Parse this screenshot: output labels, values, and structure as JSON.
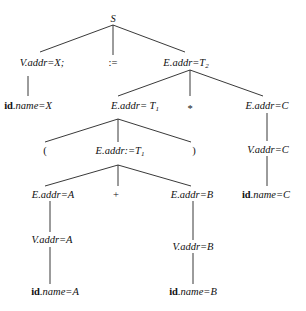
{
  "diagram": {
    "nodes": {
      "root": {
        "text": "S"
      },
      "v_x": {
        "text": "V.addr=X;"
      },
      "assign": {
        "text": ":="
      },
      "e_t2": {
        "text": "E.addr=T",
        "sub": "2"
      },
      "id_x": {
        "bold": "id",
        "text": ".name=X"
      },
      "e_t1": {
        "text": "E.addr= T",
        "sub": "1"
      },
      "star": {
        "text": "*"
      },
      "e_c": {
        "text": "E.addr=C"
      },
      "lparen": {
        "text": "("
      },
      "e_t1b": {
        "text": "E.addr:=T",
        "sub": "1"
      },
      "rparen": {
        "text": ")"
      },
      "v_c": {
        "text": "V.addr=C"
      },
      "e_a": {
        "text": "E.addr=A"
      },
      "plus": {
        "text": "+"
      },
      "e_b": {
        "text": "E.addr=B"
      },
      "id_c": {
        "bold": "id",
        "text": ".name=C"
      },
      "v_a": {
        "text": "V.addr=A"
      },
      "v_b": {
        "text": "V.addr=B"
      },
      "id_a": {
        "bold": "id",
        "text": ".name=A"
      },
      "id_b": {
        "bold": "id",
        "text": ".name=B"
      }
    }
  }
}
